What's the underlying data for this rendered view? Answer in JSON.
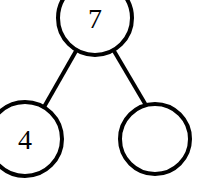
{
  "diagram": {
    "type": "binary-tree",
    "title": "",
    "canvas": {
      "width": 201,
      "height": 180,
      "background": "#ffffff"
    },
    "style": {
      "stroke_color": "#000000",
      "node_fill": "#ffffff",
      "stroke_width": 4,
      "edge_width": 4,
      "label_color": "#000000",
      "label_font_size": 28
    },
    "nodes": [
      {
        "id": "root",
        "label": "7",
        "cx": 95,
        "cy": 18,
        "r": 37,
        "has_label": true,
        "clipped_edge": "top"
      },
      {
        "id": "left-child",
        "label": "4",
        "cx": 25,
        "cy": 139,
        "r": 37,
        "has_label": true,
        "clipped_edge": "left"
      },
      {
        "id": "right-child",
        "label": "",
        "cx": 155,
        "cy": 139,
        "r": 35,
        "has_label": false,
        "clipped_edge": "none"
      }
    ],
    "edges": [
      {
        "id": "root-to-left",
        "from": "root",
        "to": "left-child",
        "x1": 76,
        "y1": 51,
        "x2": 44,
        "y2": 107
      },
      {
        "id": "root-to-right",
        "from": "root",
        "to": "right-child",
        "x1": 114,
        "y1": 51,
        "x2": 147,
        "y2": 107
      }
    ]
  }
}
